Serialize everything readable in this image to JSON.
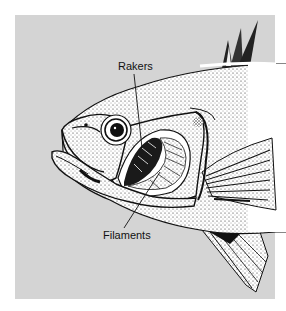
{
  "figure": {
    "labels": {
      "rakers": "Rakers",
      "filaments": "Filaments"
    },
    "colors": {
      "panel_background": "#d4d4d4",
      "page_background": "#ffffff",
      "ink": "#111111",
      "fish_body": "#ffffff"
    }
  }
}
